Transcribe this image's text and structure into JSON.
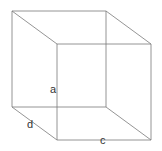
{
  "diagram": {
    "type": "wireframe-cube",
    "colors": {
      "edge": "#7a7a7a",
      "label": "#333333",
      "background": "#ffffff"
    },
    "vertices": {
      "btl": [
        12,
        11
      ],
      "btr": [
        106,
        11
      ],
      "bbl": [
        12,
        107
      ],
      "bbr": [
        106,
        107
      ],
      "ftl": [
        57,
        44
      ],
      "ftr": [
        151,
        44
      ],
      "fbl": [
        57,
        140
      ],
      "fbr": [
        151,
        140
      ]
    },
    "labels": [
      {
        "id": "a",
        "text": "a",
        "x": 50,
        "y": 93
      },
      {
        "id": "d",
        "text": "d",
        "x": 27,
        "y": 128
      },
      {
        "id": "c",
        "text": "c",
        "x": 100,
        "y": 144
      }
    ]
  }
}
